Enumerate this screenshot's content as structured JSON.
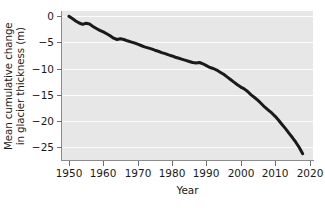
{
  "chart_data": {
    "type": "line",
    "title": "",
    "xlabel": "Year",
    "ylabel_line1": "Mean cumulative change",
    "ylabel_line2": "in glacier thickness (m)",
    "ylabel": "Mean cumulative change in glacier thickness (m)",
    "xlim": [
      1948,
      2021
    ],
    "ylim": [
      -27.5,
      1.0
    ],
    "xticks": [
      1950,
      1960,
      1970,
      1980,
      1990,
      2000,
      2010,
      2020
    ],
    "xtick_labels": [
      "1950",
      "1960",
      "1970",
      "1980",
      "1990",
      "2000",
      "2010",
      "2020"
    ],
    "yticks": [
      0,
      -5,
      -10,
      -15,
      -20,
      -25
    ],
    "ytick_labels": [
      "0",
      "-5",
      "-10",
      "-15",
      "-20",
      "-25"
    ],
    "grid": "horizontal",
    "gridline_color": "#fbfbfb",
    "plot_background": "#e7e7e7",
    "line_color": "#1a1a1a",
    "line_width": 3.0,
    "legend": null,
    "series": [
      {
        "name": "Mean cumulative change in glacier thickness",
        "x": [
          1950,
          1951,
          1952,
          1953,
          1954,
          1955,
          1956,
          1957,
          1958,
          1959,
          1960,
          1961,
          1962,
          1963,
          1964,
          1965,
          1966,
          1967,
          1968,
          1969,
          1970,
          1971,
          1972,
          1973,
          1974,
          1975,
          1976,
          1977,
          1978,
          1979,
          1980,
          1981,
          1982,
          1983,
          1984,
          1985,
          1986,
          1987,
          1988,
          1989,
          1990,
          1991,
          1992,
          1993,
          1994,
          1995,
          1996,
          1997,
          1998,
          1999,
          2000,
          2001,
          2002,
          2003,
          2004,
          2005,
          2006,
          2007,
          2008,
          2009,
          2010,
          2011,
          2012,
          2013,
          2014,
          2015,
          2016,
          2017,
          2018
        ],
        "values": [
          0.0,
          -0.45,
          -0.9,
          -1.3,
          -1.55,
          -1.35,
          -1.5,
          -1.95,
          -2.35,
          -2.7,
          -3.0,
          -3.35,
          -3.75,
          -4.2,
          -4.45,
          -4.3,
          -4.45,
          -4.7,
          -4.9,
          -5.1,
          -5.35,
          -5.6,
          -5.85,
          -6.05,
          -6.25,
          -6.5,
          -6.7,
          -6.95,
          -7.15,
          -7.4,
          -7.6,
          -7.85,
          -8.05,
          -8.25,
          -8.45,
          -8.65,
          -8.85,
          -8.95,
          -8.85,
          -9.1,
          -9.45,
          -9.8,
          -10.0,
          -10.3,
          -10.7,
          -11.1,
          -11.6,
          -12.1,
          -12.6,
          -13.1,
          -13.55,
          -13.9,
          -14.4,
          -15.05,
          -15.55,
          -16.1,
          -16.75,
          -17.4,
          -17.95,
          -18.5,
          -19.15,
          -19.9,
          -20.7,
          -21.5,
          -22.35,
          -23.2,
          -24.1,
          -25.1,
          -26.3
        ]
      }
    ]
  }
}
